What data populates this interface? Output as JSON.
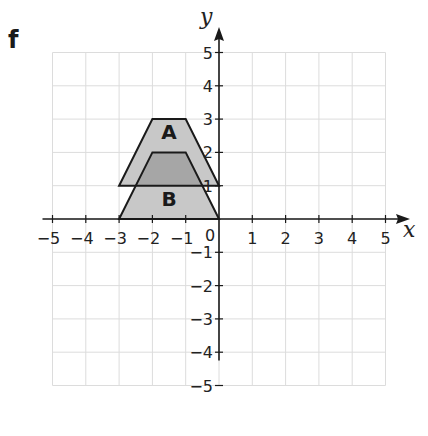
{
  "part_label": "f",
  "chart_data": {
    "type": "coordinate-grid",
    "x_axis": {
      "label": "x",
      "min": -5,
      "max": 5,
      "ticks": [
        -5,
        -4,
        -3,
        -2,
        -1,
        1,
        2,
        3,
        4,
        5
      ]
    },
    "y_axis": {
      "label": "y",
      "min": -5,
      "max": 5,
      "ticks": [
        -5,
        -4,
        -3,
        -2,
        -1,
        1,
        2,
        3,
        4,
        5
      ]
    },
    "origin_label": "0",
    "grid": true,
    "shapes": [
      {
        "name": "A",
        "type": "trapezium",
        "vertices": [
          [
            -3,
            1
          ],
          [
            0,
            1
          ],
          [
            -1,
            3
          ],
          [
            -2,
            3
          ]
        ],
        "label_pos": [
          -1.5,
          2.4
        ]
      },
      {
        "name": "B",
        "type": "trapezium",
        "vertices": [
          [
            -3,
            0
          ],
          [
            0,
            0
          ],
          [
            -1,
            2
          ],
          [
            -2,
            2
          ]
        ],
        "label_pos": [
          -1.5,
          0.4
        ]
      }
    ],
    "colors": {
      "shape_fill": "#c8c8c8",
      "overlap_fill": "#a6a6a6",
      "outline": "#1a1a1a",
      "grid": "#dcdcdc"
    }
  }
}
